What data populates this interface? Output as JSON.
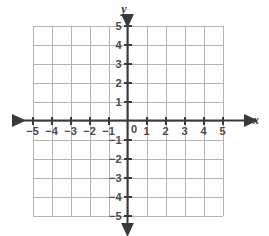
{
  "figure": {
    "kind": "cartesian-coordinate-grid",
    "background_color": "#ffffff",
    "grid_color": "#b3b3b3",
    "axis_color": "#3a3a3a",
    "label_color": "#4a4a4a"
  },
  "axes": {
    "x": {
      "name": "x",
      "min": -5,
      "max": 5,
      "tick_labels": [
        "-5",
        "-4",
        "-3",
        "-2",
        "-1",
        "1",
        "2",
        "3",
        "4",
        "5"
      ],
      "tick_values": [
        -5,
        -4,
        -3,
        -2,
        -1,
        1,
        2,
        3,
        4,
        5
      ],
      "arrow_start": true,
      "arrow_end": true
    },
    "y": {
      "name": "y",
      "min": -5,
      "max": 5,
      "tick_labels": [
        "5",
        "4",
        "3",
        "2",
        "1",
        "-1",
        "-2",
        "-3",
        "-4",
        "-5"
      ],
      "tick_values": [
        5,
        4,
        3,
        2,
        1,
        -1,
        -2,
        -3,
        -4,
        -5
      ],
      "arrow_start": true,
      "arrow_end": true
    }
  },
  "origin": {
    "label": "0",
    "value": 0
  },
  "grid": {
    "step": 1,
    "visible": true,
    "x_lines": [
      -5,
      -4,
      -3,
      -2,
      -1,
      0,
      1,
      2,
      3,
      4,
      5
    ],
    "y_lines": [
      -5,
      -4,
      -3,
      -2,
      -1,
      0,
      1,
      2,
      3,
      4,
      5
    ]
  },
  "plotted_points": [],
  "plotted_curves": []
}
